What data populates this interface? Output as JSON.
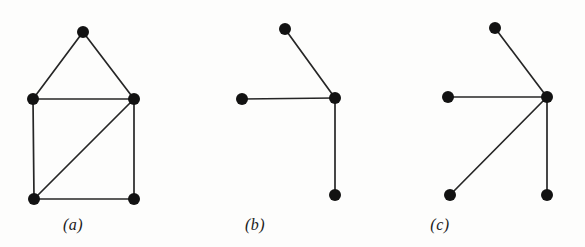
{
  "figure": {
    "background_color": "#fdfdfc",
    "node_color": "#121212",
    "edge_color": "#262626",
    "node_radius": 6,
    "edge_width": 1.7,
    "width": 585,
    "height": 247
  },
  "panels": [
    {
      "id": "panel-a",
      "caption": "(a)",
      "caption_x": 73,
      "caption_y": 225,
      "node_count": 5,
      "edge_count": 6,
      "nodes": [
        {
          "name": "a-apex",
          "x": 83,
          "y": 32
        },
        {
          "name": "a-left-middle",
          "x": 33,
          "y": 99
        },
        {
          "name": "a-right-middle",
          "x": 134,
          "y": 99
        },
        {
          "name": "a-left-bottom",
          "x": 34,
          "y": 199
        },
        {
          "name": "a-right-bottom",
          "x": 134,
          "y": 199
        }
      ],
      "edges": [
        {
          "from": "a-apex",
          "to": "a-left-middle"
        },
        {
          "from": "a-apex",
          "to": "a-right-middle"
        },
        {
          "from": "a-left-middle",
          "to": "a-right-middle"
        },
        {
          "from": "a-left-middle",
          "to": "a-left-bottom"
        },
        {
          "from": "a-right-middle",
          "to": "a-right-bottom"
        },
        {
          "from": "a-left-bottom",
          "to": "a-right-bottom"
        },
        {
          "from": "a-left-bottom",
          "to": "a-right-middle"
        }
      ]
    },
    {
      "id": "panel-b",
      "caption": "(b)",
      "caption_x": 255,
      "caption_y": 225,
      "node_count": 4,
      "edge_count": 3,
      "nodes": [
        {
          "name": "b-top",
          "x": 285,
          "y": 29
        },
        {
          "name": "b-center",
          "x": 335,
          "y": 98
        },
        {
          "name": "b-left",
          "x": 242,
          "y": 99
        },
        {
          "name": "b-bottom",
          "x": 335,
          "y": 195
        }
      ],
      "edges": [
        {
          "from": "b-top",
          "to": "b-center"
        },
        {
          "from": "b-left",
          "to": "b-center"
        },
        {
          "from": "b-center",
          "to": "b-bottom"
        }
      ]
    },
    {
      "id": "panel-c",
      "caption": "(c)",
      "caption_x": 440,
      "caption_y": 225,
      "node_count": 5,
      "edge_count": 4,
      "nodes": [
        {
          "name": "c-top",
          "x": 495,
          "y": 28
        },
        {
          "name": "c-center",
          "x": 547,
          "y": 97
        },
        {
          "name": "c-left",
          "x": 448,
          "y": 97
        },
        {
          "name": "c-bottom-left",
          "x": 450,
          "y": 195
        },
        {
          "name": "c-bottom-right",
          "x": 547,
          "y": 195
        }
      ],
      "edges": [
        {
          "from": "c-top",
          "to": "c-center"
        },
        {
          "from": "c-left",
          "to": "c-center"
        },
        {
          "from": "c-bottom-left",
          "to": "c-center"
        },
        {
          "from": "c-center",
          "to": "c-bottom-right"
        }
      ]
    }
  ]
}
